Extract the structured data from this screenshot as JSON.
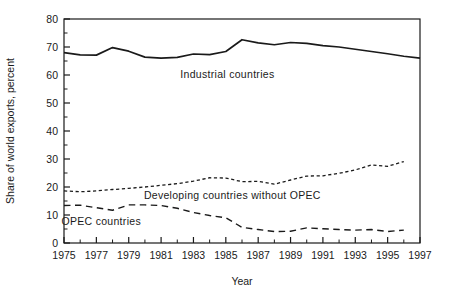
{
  "chart_data": {
    "type": "line",
    "title": "",
    "xlabel": "Year",
    "ylabel": "Share of world exports, percent",
    "xlim": [
      1975,
      1997
    ],
    "ylim": [
      0,
      80
    ],
    "grid": false,
    "legend_position": "inline-annotations",
    "y_ticks_major": [
      0,
      10,
      20,
      30,
      40,
      50,
      60,
      70,
      80
    ],
    "y_ticks_minor": [
      5,
      15,
      25,
      35,
      45,
      55,
      65,
      75
    ],
    "x_ticks_major": [
      1975,
      1977,
      1979,
      1981,
      1983,
      1985,
      1987,
      1989,
      1991,
      1993,
      1995,
      1997
    ],
    "x_ticks_minor": [
      1976,
      1978,
      1980,
      1982,
      1984,
      1986,
      1988,
      1990,
      1992,
      1994,
      1996
    ],
    "y_tick_labels": [
      "0",
      "10",
      "20",
      "30",
      "40",
      "50",
      "60",
      "70",
      "80"
    ],
    "x_tick_labels": [
      "1975",
      "1977",
      "1979",
      "1981",
      "1983",
      "1985",
      "1987",
      "1989",
      "1991",
      "1993",
      "1995",
      "1997"
    ],
    "series": [
      {
        "name": "Industrial countries",
        "label": "Industrial  countries",
        "style": "solid",
        "color": "#1a1a1a",
        "width": 1.7,
        "label_x": 1985.1,
        "label_y": 59.0,
        "x": [
          1975,
          1976,
          1977,
          1978,
          1979,
          1980,
          1981,
          1982,
          1983,
          1984,
          1985,
          1986,
          1987,
          1988,
          1989,
          1990,
          1991,
          1992,
          1993,
          1994,
          1995,
          1996,
          1997
        ],
        "values": [
          68.0,
          67.2,
          67.1,
          69.8,
          68.5,
          66.4,
          66.0,
          66.3,
          67.5,
          67.3,
          68.4,
          72.6,
          71.5,
          70.8,
          71.6,
          71.3,
          70.5,
          70.0,
          69.2,
          68.4,
          67.6,
          66.7,
          66.0
        ]
      },
      {
        "name": "Developing countries without OPEC",
        "label": "Developing  countries  without  OPEC",
        "style": "dotted",
        "color": "#1a1a1a",
        "width": 1.3,
        "dash": "3.2,2.6",
        "label_x": 1985.4,
        "label_y": 15.6,
        "x": [
          1975,
          1976,
          1977,
          1978,
          1979,
          1980,
          1981,
          1982,
          1983,
          1984,
          1985,
          1986,
          1987,
          1988,
          1989,
          1990,
          1991,
          1992,
          1993,
          1994,
          1995,
          1996
        ],
        "values": [
          18.6,
          18.3,
          18.6,
          19.1,
          19.5,
          20.0,
          20.6,
          21.2,
          22.1,
          23.3,
          23.2,
          21.9,
          22.0,
          21.0,
          22.5,
          23.9,
          24.0,
          24.9,
          26.1,
          27.9,
          27.4,
          29.1
        ]
      },
      {
        "name": "OPEC countries",
        "label": "OPEC  countries",
        "style": "dashed",
        "color": "#1a1a1a",
        "width": 1.4,
        "dash": "6.5,4.5",
        "label_x": 1977.3,
        "label_y": 6.3,
        "x": [
          1975,
          1976,
          1977,
          1978,
          1979,
          1980,
          1981,
          1982,
          1983,
          1984,
          1985,
          1986,
          1987,
          1988,
          1989,
          1990,
          1991,
          1992,
          1993,
          1994,
          1995,
          1996
        ],
        "values": [
          13.4,
          13.5,
          12.6,
          11.7,
          13.6,
          13.6,
          13.4,
          12.4,
          10.9,
          9.8,
          9.0,
          5.6,
          4.8,
          4.1,
          4.2,
          5.4,
          5.1,
          4.8,
          4.6,
          4.8,
          4.1,
          4.6
        ]
      }
    ]
  },
  "axes": {
    "y_axis_title": "Share of world exports, percent",
    "x_axis_title": "Year"
  }
}
